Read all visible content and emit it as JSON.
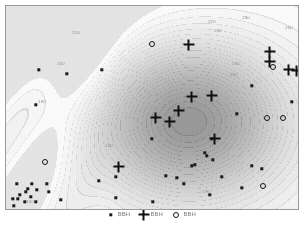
{
  "figure": {
    "title": "",
    "background_color": "#ffffff",
    "frame_color": "#9a9a9a"
  },
  "chart_data": {
    "type": "heatmap",
    "title": "",
    "subtitle": "",
    "xlabel": "",
    "ylabel": "",
    "grid": false,
    "legend_position": "bottom",
    "colormap": "grayscale",
    "axis_ranges": {
      "xlim": [
        0,
        292
      ],
      "ylim": [
        0,
        203
      ],
      "axis_units": "pixels"
    },
    "contour_labels": [
      {
        "label": "270",
        "x": 206,
        "y": 16
      },
      {
        "label": "280",
        "x": 240,
        "y": 12
      },
      {
        "label": "260",
        "x": 212,
        "y": 25
      },
      {
        "label": "250",
        "x": 283,
        "y": 22
      },
      {
        "label": "230",
        "x": 230,
        "y": 58
      },
      {
        "label": "220",
        "x": 228,
        "y": 69
      },
      {
        "label": "210",
        "x": 70,
        "y": 27
      },
      {
        "label": "200",
        "x": 55,
        "y": 58
      },
      {
        "label": "190",
        "x": 36,
        "y": 96
      },
      {
        "label": "180",
        "x": 103,
        "y": 140
      },
      {
        "label": "170",
        "x": 200,
        "y": 186
      },
      {
        "label": "160",
        "x": 24,
        "y": 196
      }
    ],
    "contour_levels": [
      160,
      170,
      180,
      190,
      200,
      210,
      220,
      230,
      240,
      250,
      260,
      270,
      280
    ],
    "series": [
      {
        "name": "dot-series",
        "marker": "dot",
        "count": 42,
        "points": [
          [
            33,
            64
          ],
          [
            96,
            64
          ],
          [
            61,
            68
          ],
          [
            30,
            99
          ],
          [
            246,
            80
          ],
          [
            294,
            94
          ],
          [
            231,
            108
          ],
          [
            146,
            133
          ],
          [
            206,
            133
          ],
          [
            199,
            147
          ],
          [
            201,
            150
          ],
          [
            207,
            154
          ],
          [
            189,
            159
          ],
          [
            110,
            171
          ],
          [
            186,
            160
          ],
          [
            216,
            171
          ],
          [
            246,
            160
          ],
          [
            236,
            182
          ],
          [
            110,
            192
          ],
          [
            147,
            196
          ],
          [
            204,
            189
          ],
          [
            11,
            178
          ],
          [
            22,
            183
          ],
          [
            14,
            189
          ],
          [
            25,
            191
          ],
          [
            31,
            184
          ],
          [
            19,
            196
          ],
          [
            8,
            200
          ],
          [
            41,
            178
          ],
          [
            55,
            194
          ],
          [
            30,
            196
          ],
          [
            12,
            193
          ],
          [
            20,
            186
          ],
          [
            43,
            186
          ],
          [
            7,
            193
          ],
          [
            26,
            178
          ],
          [
            171,
            172
          ],
          [
            160,
            170
          ],
          [
            178,
            178
          ],
          [
            93,
            175
          ],
          [
            256,
            163
          ],
          [
            286,
            96
          ]
        ]
      },
      {
        "name": "plus-series",
        "marker": "plus",
        "count": 12,
        "points": [
          [
            183,
            39
          ],
          [
            264,
            46
          ],
          [
            264,
            56
          ],
          [
            283,
            64
          ],
          [
            291,
            65
          ],
          [
            186,
            91
          ],
          [
            206,
            90
          ],
          [
            150,
            112
          ],
          [
            164,
            116
          ],
          [
            173,
            105
          ],
          [
            209,
            133
          ],
          [
            113,
            161
          ]
        ]
      },
      {
        "name": "circle-series",
        "marker": "circle",
        "count": 6,
        "points": [
          [
            146,
            38
          ],
          [
            267,
            61
          ],
          [
            261,
            112
          ],
          [
            277,
            112
          ],
          [
            39,
            156
          ],
          [
            257,
            180
          ]
        ]
      }
    ]
  },
  "legend": {
    "entries": [
      {
        "marker": "dot",
        "label": "BBH"
      },
      {
        "marker": "plus",
        "label": "BBH"
      },
      {
        "marker": "circle",
        "label": "BBH"
      }
    ]
  }
}
